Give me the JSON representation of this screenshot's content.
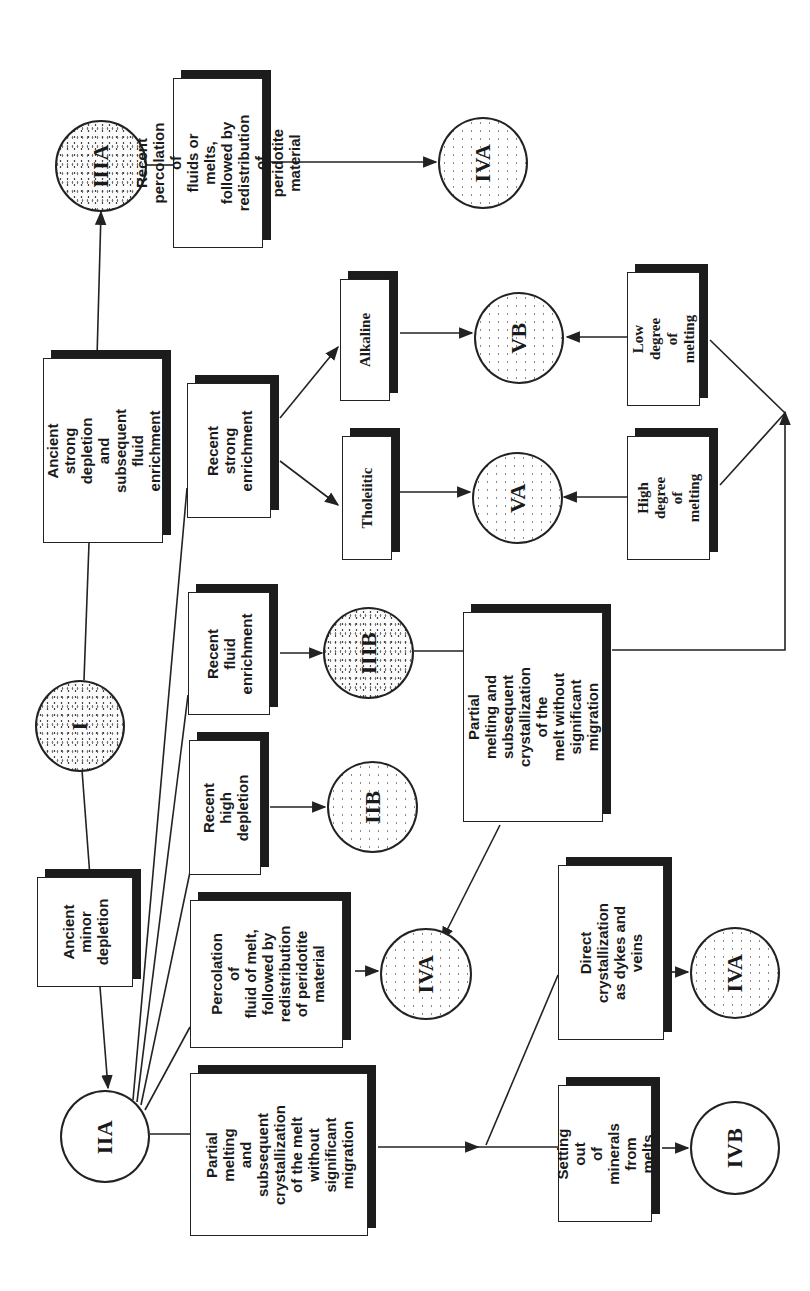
{
  "diagram": {
    "orientation": "rotated 90 degrees counter-clockwise",
    "nodes": {
      "I": {
        "label": "I"
      },
      "IIA": {
        "label": "IIA"
      },
      "IIB": {
        "label": "IIB"
      },
      "IIIA": {
        "label": "IIIA"
      },
      "IIIB": {
        "label": "IIIB"
      },
      "IVA_top": {
        "label": "IVA"
      },
      "IVA_mid": {
        "label": "IVA"
      },
      "IVA_bottom": {
        "label": "IVA"
      },
      "IVB": {
        "label": "IVB"
      },
      "VA": {
        "label": "VA"
      },
      "VB": {
        "label": "VB"
      }
    },
    "processes": {
      "ancient_strong": {
        "label": "Ancient strong\ndepletion and\nsubsequent fluid\nenrichment"
      },
      "ancient_minor": {
        "label": "Ancient\nminor\ndepletion"
      },
      "recent_percolation": {
        "label": "Recent\npercolation of\nfluids or melts,\nfollowed by\nredistribution of\nperidotite\nmaterial"
      },
      "recent_strong_enrichment": {
        "label": "Recent\nstrong\nenrichment"
      },
      "alkaline": {
        "label": "Alkaline"
      },
      "tholeiitic": {
        "label": "Tholeiitic"
      },
      "low_degree": {
        "label": "Low degree\nof melting"
      },
      "high_degree": {
        "label": "High\ndegree of\nmelting"
      },
      "recent_fluid_enrichment": {
        "label": "Recent\nfluid\nenrichment"
      },
      "partial_melting_center": {
        "label": "Partial melting and\nsubsequent\ncrystallization of the\nmelt without\nsignificant migration"
      },
      "recent_high_depletion": {
        "label": "Recent high\ndepletion"
      },
      "percolation_fluid_melt": {
        "label": "Percolation of\nfluid of melt,\nfollowed by\nredistribution\nof peridotite\nmaterial"
      },
      "partial_melting_left": {
        "label": "Partial melting\nand subsequent\ncrystallization\nof the melt\nwithout\nsignificant\nmigration"
      },
      "direct_crystallization": {
        "label": "Direct\ncrystallization\nas dykes and\nveins"
      },
      "setting_out": {
        "label": "Setting out\nof minerals\nfrom melts"
      }
    },
    "edges": [
      [
        "I",
        "ancient_strong"
      ],
      [
        "ancient_strong",
        "IIIA"
      ],
      [
        "IIIA",
        "recent_percolation"
      ],
      [
        "recent_percolation",
        "IVA_top"
      ],
      [
        "I",
        "ancient_minor"
      ],
      [
        "ancient_minor",
        "IIA"
      ],
      [
        "IIA",
        "recent_strong_enrichment"
      ],
      [
        "IIA",
        "recent_fluid_enrichment"
      ],
      [
        "IIA",
        "recent_high_depletion"
      ],
      [
        "IIA",
        "percolation_fluid_melt"
      ],
      [
        "IIA",
        "partial_melting_left"
      ],
      [
        "recent_strong_enrichment",
        "alkaline"
      ],
      [
        "recent_strong_enrichment",
        "tholeiitic"
      ],
      [
        "alkaline",
        "VB"
      ],
      [
        "tholeiitic",
        "VA"
      ],
      [
        "low_degree",
        "VB"
      ],
      [
        "high_degree",
        "VA"
      ],
      [
        "recent_fluid_enrichment",
        "IIIB"
      ],
      [
        "IIIB",
        "partial_melting_center"
      ],
      [
        "partial_melting_center",
        "low_degree"
      ],
      [
        "partial_melting_center",
        "high_degree"
      ],
      [
        "partial_melting_center",
        "IVA_mid"
      ],
      [
        "recent_high_depletion",
        "IIB"
      ],
      [
        "percolation_fluid_melt",
        "IVA_mid"
      ],
      [
        "partial_melting_left",
        "direct_crystallization"
      ],
      [
        "partial_melting_left",
        "setting_out"
      ],
      [
        "direct_crystallization",
        "IVA_bottom"
      ],
      [
        "setting_out",
        "IVB"
      ]
    ]
  }
}
